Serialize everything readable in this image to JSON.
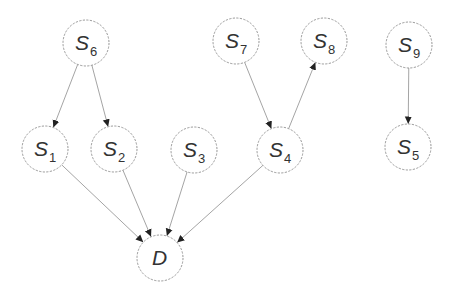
{
  "diagram": {
    "type": "directed-graph",
    "colors": {
      "edge": "#9a9a9a",
      "arrowhead": "#222222",
      "node_stroke": "#8c8c8c",
      "label": "#333333",
      "background": "#ffffff"
    },
    "nodes": [
      {
        "id": "S6",
        "label": "S",
        "sub": "6",
        "x": 86,
        "y": 43
      },
      {
        "id": "S7",
        "label": "S",
        "sub": "7",
        "x": 236,
        "y": 41
      },
      {
        "id": "S8",
        "label": "S",
        "sub": "8",
        "x": 324,
        "y": 41
      },
      {
        "id": "S9",
        "label": "S",
        "sub": "9",
        "x": 409,
        "y": 45
      },
      {
        "id": "S1",
        "label": "S",
        "sub": "1",
        "x": 45,
        "y": 149
      },
      {
        "id": "S2",
        "label": "S",
        "sub": "2",
        "x": 114,
        "y": 149
      },
      {
        "id": "S3",
        "label": "S",
        "sub": "3",
        "x": 194,
        "y": 150
      },
      {
        "id": "S4",
        "label": "S",
        "sub": "4",
        "x": 280,
        "y": 150
      },
      {
        "id": "S5",
        "label": "S",
        "sub": "5",
        "x": 408,
        "y": 147
      },
      {
        "id": "D",
        "label": "D",
        "sub": "",
        "x": 160,
        "y": 258
      }
    ],
    "edges": [
      {
        "from": "S6",
        "to": "S1"
      },
      {
        "from": "S6",
        "to": "S2"
      },
      {
        "from": "S7",
        "to": "S4"
      },
      {
        "from": "S4",
        "to": "S8"
      },
      {
        "from": "S9",
        "to": "S5"
      },
      {
        "from": "S1",
        "to": "D"
      },
      {
        "from": "S2",
        "to": "D"
      },
      {
        "from": "S3",
        "to": "D"
      },
      {
        "from": "S4",
        "to": "D"
      }
    ],
    "node_radius": 23
  }
}
